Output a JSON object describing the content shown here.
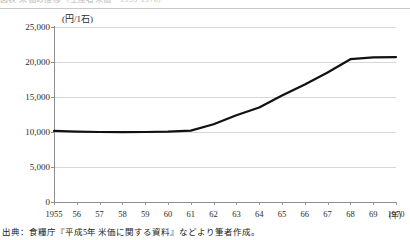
{
  "top_caption": "図表 米価の推移（生産者米価・1955-1970）",
  "chart_data": {
    "type": "line",
    "title": "",
    "subtitle": "",
    "xlabel": "年",
    "ylabel": "",
    "unit_label": "(円/1石)",
    "xaxis_unit_suffix": "(年)",
    "grid": true,
    "legend": "none",
    "ylim": [
      0,
      25000
    ],
    "ytick_labels": [
      "25,000",
      "20,000",
      "15,000",
      "10,000",
      "5,000",
      "0"
    ],
    "ytick_values": [
      25000,
      20000,
      15000,
      10000,
      5000,
      0
    ],
    "categories": [
      "1955",
      "56",
      "57",
      "58",
      "59",
      "60",
      "61",
      "62",
      "63",
      "64",
      "65",
      "66",
      "67",
      "68",
      "69",
      "1970"
    ],
    "x_values": [
      1955,
      1956,
      1957,
      1958,
      1959,
      1960,
      1961,
      1962,
      1963,
      1964,
      1965,
      1966,
      1967,
      1968,
      1969,
      1970
    ],
    "series": [
      {
        "name": "生産者米価",
        "color": "#111111",
        "values": [
          10150,
          10050,
          10000,
          9980,
          10000,
          10050,
          10200,
          11100,
          12400,
          13500,
          15200,
          16800,
          18500,
          20400,
          20650,
          20700
        ]
      }
    ]
  },
  "source": {
    "note": "出典：食糧庁『平成5年 米価に関する資料』などより筆者作成。"
  }
}
